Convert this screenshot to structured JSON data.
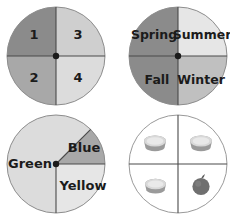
{
  "page": {
    "background": "#ffffff",
    "width": 234,
    "height": 220
  },
  "palette": {
    "dark_gray": "#8b8b8b",
    "mid_gray": "#a8a8a8",
    "light_gray": "#cfcfcf",
    "lighter_gray": "#dcdcdc",
    "pale_gray": "#e6e6e6",
    "white": "#ffffff",
    "line": "#4a4a4a",
    "rim": "#8d8d8d",
    "text": "#1b1b1b",
    "bowl_rim": "#d8d8d8",
    "bowl_body": "#9a9a9a",
    "apple": "#6f6f6f"
  },
  "spinners": [
    {
      "id": "numbers",
      "name": "spinner-numbers",
      "type": "pie",
      "equal_sectors": true,
      "sector_count": 4,
      "sectors": [
        {
          "label": "1",
          "start_deg": 90,
          "end_deg": 180,
          "sweep_deg": 90,
          "fill": "#8b8b8b",
          "quadrant": "upper-left"
        },
        {
          "label": "3",
          "start_deg": 0,
          "end_deg": 90,
          "sweep_deg": 90,
          "fill": "#cfcfcf",
          "quadrant": "upper-right"
        },
        {
          "label": "2",
          "start_deg": 180,
          "end_deg": 270,
          "sweep_deg": 90,
          "fill": "#a8a8a8",
          "quadrant": "lower-left"
        },
        {
          "label": "4",
          "start_deg": 270,
          "end_deg": 360,
          "sweep_deg": 90,
          "fill": "#dcdcdc",
          "quadrant": "lower-right"
        }
      ]
    },
    {
      "id": "seasons",
      "name": "spinner-seasons",
      "type": "pie",
      "equal_sectors": true,
      "sector_count": 4,
      "sectors": [
        {
          "label": "Spring",
          "start_deg": 90,
          "end_deg": 180,
          "sweep_deg": 90,
          "fill": "#8b8b8b",
          "quadrant": "upper-left"
        },
        {
          "label": "Summer",
          "start_deg": 0,
          "end_deg": 90,
          "sweep_deg": 90,
          "fill": "#e6e6e6",
          "quadrant": "upper-right"
        },
        {
          "label": "Fall",
          "start_deg": 180,
          "end_deg": 270,
          "sweep_deg": 90,
          "fill": "#8b8b8b",
          "quadrant": "lower-left"
        },
        {
          "label": "Winter",
          "start_deg": 270,
          "end_deg": 360,
          "sweep_deg": 90,
          "fill": "#c0c0c0",
          "quadrant": "lower-right"
        }
      ]
    },
    {
      "id": "colors",
      "name": "spinner-colors",
      "type": "pie",
      "equal_sectors": false,
      "sector_count": 3,
      "sectors": [
        {
          "label": "Green",
          "start_deg": 45,
          "end_deg": 270,
          "sweep_deg": 225,
          "fill": "#dcdcdc",
          "quadrant": "left-and-top"
        },
        {
          "label": "Blue",
          "start_deg": 0,
          "end_deg": 45,
          "sweep_deg": 45,
          "fill": "#a8a8a8",
          "quadrant": "upper-right-wedge"
        },
        {
          "label": "Yellow",
          "start_deg": 270,
          "end_deg": 360,
          "sweep_deg": 90,
          "fill": "#e6e6e6",
          "quadrant": "lower-right"
        }
      ]
    },
    {
      "id": "objects",
      "name": "spinner-objects",
      "type": "pie",
      "equal_sectors": true,
      "sector_count": 4,
      "sectors": [
        {
          "label": "",
          "icon": "bowl-icon",
          "start_deg": 90,
          "end_deg": 180,
          "sweep_deg": 90,
          "fill": "#ffffff",
          "quadrant": "upper-left"
        },
        {
          "label": "",
          "icon": "bowl-icon",
          "start_deg": 0,
          "end_deg": 90,
          "sweep_deg": 90,
          "fill": "#ffffff",
          "quadrant": "upper-right"
        },
        {
          "label": "",
          "icon": "bowl-icon",
          "start_deg": 180,
          "end_deg": 270,
          "sweep_deg": 90,
          "fill": "#ffffff",
          "quadrant": "lower-left"
        },
        {
          "label": "",
          "icon": "apple-icon",
          "start_deg": 270,
          "end_deg": 360,
          "sweep_deg": 90,
          "fill": "#ffffff",
          "quadrant": "lower-right"
        }
      ]
    }
  ]
}
